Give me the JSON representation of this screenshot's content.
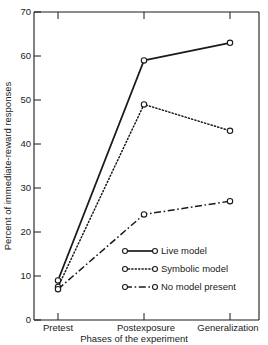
{
  "chart_data": {
    "type": "line",
    "title": "",
    "xlabel": "Phases of the experiment",
    "ylabel": "Percent of immediate-reward responses",
    "categories": [
      "Pretest",
      "Postexposure",
      "Generalization"
    ],
    "ylim": [
      0,
      70
    ],
    "yticks": [
      0,
      10,
      20,
      30,
      40,
      50,
      60,
      70
    ],
    "ytick_labels": [
      "0",
      "10",
      "20",
      "30",
      "40",
      "50",
      "60",
      "70"
    ],
    "grid": false,
    "legend_position": "lower-right-inside",
    "series": [
      {
        "name": "Live model",
        "values": [
          9,
          59,
          63
        ],
        "line_style": "solid",
        "color": "#1a1a1a",
        "marker": "open-circle"
      },
      {
        "name": "Symbolic model",
        "values": [
          7.5,
          49,
          43
        ],
        "line_style": "dotted",
        "color": "#1a1a1a",
        "marker": "open-circle"
      },
      {
        "name": "No model present",
        "values": [
          7,
          24,
          27
        ],
        "line_style": "dash-dot",
        "color": "#1a1a1a",
        "marker": "open-circle"
      }
    ]
  },
  "legend": {
    "items": [
      {
        "label": "Live model"
      },
      {
        "label": "Symbolic model"
      },
      {
        "label": "No model present"
      }
    ]
  },
  "axes": {
    "y_title": "Percent of immediate-reward responses",
    "x_title": "Phases of the experiment",
    "y_tick_0": "0",
    "y_tick_1": "10",
    "y_tick_2": "20",
    "y_tick_3": "30",
    "y_tick_4": "40",
    "y_tick_5": "50",
    "y_tick_6": "60",
    "y_tick_7": "70",
    "x_cat_0": "Pretest",
    "x_cat_1": "Postexposure",
    "x_cat_2": "Generalization"
  }
}
